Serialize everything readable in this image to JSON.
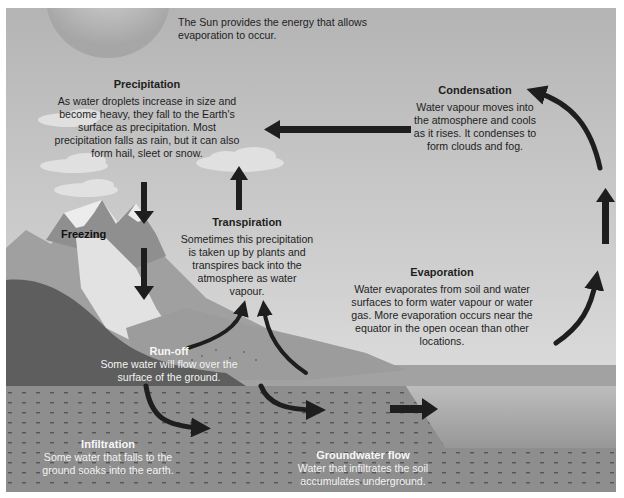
{
  "diagram": {
    "type": "water-cycle",
    "colors": {
      "sky_top": "#b4b4b4",
      "sky_bottom": "#dedede",
      "arrow": "#1e1e1e",
      "ground_dark": "#5e5e5e",
      "mountain": "#9a9a9a",
      "snow": "#ececec",
      "soil": "#8c8c8c",
      "ocean": "#a8a8a8",
      "text_dark": "#1e1e1e",
      "text_light": "#f2f2f2"
    },
    "sun": {
      "text": "The Sun provides the energy that allows evaporation to occur."
    },
    "precipitation": {
      "title": "Precipitation",
      "text": "As water droplets increase in size and become heavy, they fall to the Earth's surface as precipitation. Most precipitation falls as rain, but it can also form hail, sleet or snow."
    },
    "condensation": {
      "title": "Condensation",
      "text": "Water vapour moves into the atmosphere and cools as it rises. It condenses to form clouds and fog."
    },
    "transpiration": {
      "title": "Transpiration",
      "text": "Sometimes this precipitation is taken up by plants and transpires back into the atmosphere as water vapour."
    },
    "freezing": {
      "title": "Freezing"
    },
    "evaporation": {
      "title": "Evaporation",
      "text": "Water evaporates from soil and water surfaces to form water vapour or water gas. More evaporation occurs near the equator in the open ocean than other locations."
    },
    "runoff": {
      "title": "Run-off",
      "text": "Some water will flow over the surface of the ground."
    },
    "infiltration": {
      "title": "Infiltration",
      "text": "Some water that falls to the ground soaks into the earth."
    },
    "groundwater": {
      "title": "Groundwater flow",
      "text": "Water that infiltrates the soil accumulates underground."
    }
  }
}
